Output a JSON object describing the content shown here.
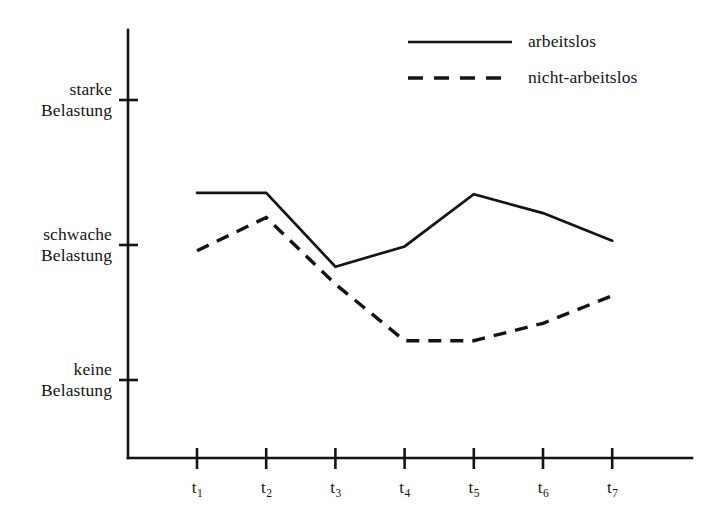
{
  "chart_data": {
    "type": "line",
    "title": "",
    "xlabel": "",
    "ylabel": "",
    "grid": false,
    "legend_position": "top-right",
    "x": [
      "t1",
      "t2",
      "t3",
      "t4",
      "t5",
      "t6",
      "t7"
    ],
    "x_tick_labels": [
      {
        "base": "t",
        "sub": "1"
      },
      {
        "base": "t",
        "sub": "2"
      },
      {
        "base": "t",
        "sub": "3"
      },
      {
        "base": "t",
        "sub": "4"
      },
      {
        "base": "t",
        "sub": "5"
      },
      {
        "base": "t",
        "sub": "6"
      },
      {
        "base": "t",
        "sub": "7"
      }
    ],
    "y_tick_labels": [
      {
        "line1": "starke",
        "line2": "Belastung",
        "value": 2
      },
      {
        "line1": "schwache",
        "line2": "Belastung",
        "value": 1
      },
      {
        "line1": "keine",
        "line2": "Belastung",
        "value": 0
      }
    ],
    "ylim": [
      -0.55,
      2.45
    ],
    "series": [
      {
        "name": "arbeitslos",
        "style": "solid",
        "color": "#141414",
        "values": [
          1.36,
          1.36,
          0.85,
          0.99,
          1.35,
          1.22,
          1.03
        ]
      },
      {
        "name": "nicht-arbeitslos",
        "style": "dashed",
        "color": "#141414",
        "values": [
          0.96,
          1.19,
          0.73,
          0.34,
          0.34,
          0.46,
          0.65
        ]
      }
    ]
  },
  "legend": {
    "entries": [
      {
        "label": "arbeitslos",
        "style": "solid"
      },
      {
        "label": "nicht-arbeitslos",
        "style": "dashed"
      }
    ]
  },
  "axes": {
    "y_axis_name": "Belastung",
    "x_axis_name": "Zeitpunkt"
  }
}
